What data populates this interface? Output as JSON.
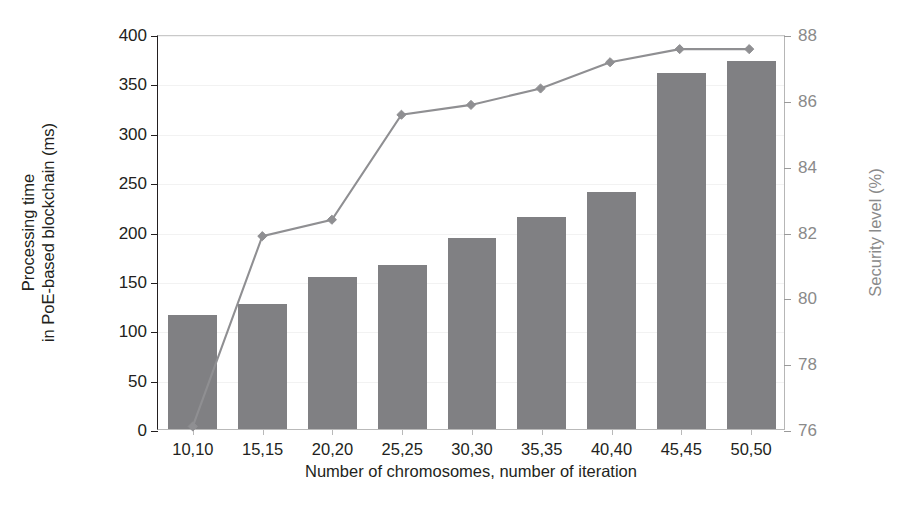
{
  "chart_data": {
    "type": "bar",
    "title": "",
    "xlabel": "Number of chromosomes, number of iteration",
    "ylabel": "Processing time\nin PoE-based blockchain (ms)",
    "ylabel_line1": "Processing time",
    "ylabel_line2": "in PoE-based blockchain (ms)",
    "y2label": "Security level (%)",
    "categories": [
      "10,10",
      "15,15",
      "20,20",
      "25,25",
      "30,30",
      "35,35",
      "40,40",
      "45,45",
      "50,50"
    ],
    "ylim": [
      0,
      400
    ],
    "yticks": [
      0,
      50,
      100,
      150,
      200,
      250,
      300,
      350,
      400
    ],
    "y2lim": [
      76,
      88
    ],
    "y2ticks": [
      76,
      78,
      80,
      82,
      84,
      86,
      88
    ],
    "grid": true,
    "legend": "none",
    "series": [
      {
        "name": "Processing time in PoE-based blockchain (ms)",
        "type": "bar",
        "axis": "left",
        "color": "#808083",
        "values": [
          115,
          127,
          154,
          166,
          193,
          215,
          240,
          361,
          373
        ]
      },
      {
        "name": "Security level (%)",
        "type": "line",
        "axis": "right",
        "color": "#8f8f92",
        "marker": "diamond",
        "values": [
          76.1,
          81.9,
          82.4,
          85.6,
          85.9,
          86.4,
          87.2,
          87.6,
          87.6
        ]
      }
    ]
  },
  "colors": {
    "bar": "#808083",
    "line": "#8f8f92",
    "left_axis": "#231f20",
    "right_axis": "#8a8a8a",
    "grid": "#f2f2f2",
    "background": "#ffffff"
  }
}
